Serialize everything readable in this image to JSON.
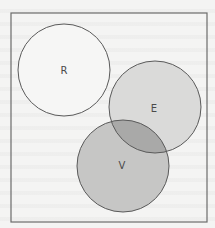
{
  "diagram": {
    "type": "venn",
    "frame": {
      "x": 11,
      "y": 13,
      "width": 196,
      "height": 209,
      "stroke": "#6b6b6b"
    },
    "background_color": "#f4f4f3",
    "sets": [
      {
        "id": "R",
        "label": "R",
        "cx": 64,
        "cy": 70,
        "r": 46,
        "fill": "#f6f6f5",
        "stroke": "#5a5a5a",
        "label_x": 64,
        "label_y": 74
      },
      {
        "id": "E",
        "label": "E",
        "cx": 155,
        "cy": 107,
        "r": 46,
        "fill": "#dadad9",
        "stroke": "#5a5a5a",
        "label_x": 154,
        "label_y": 112
      },
      {
        "id": "V",
        "label": "V",
        "cx": 123,
        "cy": 166,
        "r": 46,
        "fill": "#c6c6c5",
        "stroke": "#5a5a5a",
        "label_x": 122,
        "label_y": 169
      }
    ],
    "intersections": [
      {
        "sets": [
          "E",
          "V"
        ],
        "fill": "#a9a9a8"
      }
    ]
  }
}
